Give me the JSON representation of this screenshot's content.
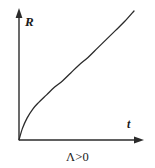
{
  "figure": {
    "background_color": "#ffffff",
    "ink_color": "#2b2b2b",
    "caption": "Λ>0"
  },
  "axes": {
    "y_label": "R",
    "x_label": "t"
  },
  "chart_data": {
    "type": "line",
    "title": "",
    "subtitle": "",
    "xlabel": "t",
    "ylabel": "R",
    "caption": "Λ>0",
    "grid": false,
    "legend": null,
    "axis_style": "arrow-tipped open axes, no tick marks, no tick labels",
    "xlim": [
      0,
      1
    ],
    "ylim": [
      0,
      1
    ],
    "annotations": [
      {
        "text": "Λ>0",
        "position": "below x-axis, centered"
      }
    ],
    "series": [
      {
        "name": "R(t)",
        "description": "scale factor growing from origin: steep initial rise, near-linear middle, slight upward concavity at late times",
        "x": [
          0.0,
          0.03,
          0.07,
          0.12,
          0.17,
          0.24,
          0.31,
          0.38,
          0.45,
          0.52,
          0.6,
          0.68,
          0.76,
          0.84,
          0.92,
          1.0
        ],
        "y": [
          0.0,
          0.09,
          0.17,
          0.24,
          0.29,
          0.35,
          0.41,
          0.46,
          0.52,
          0.58,
          0.64,
          0.71,
          0.78,
          0.85,
          0.92,
          1.0
        ]
      }
    ]
  }
}
